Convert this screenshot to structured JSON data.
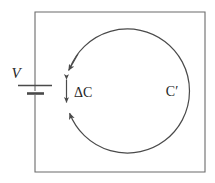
{
  "figure": {
    "type": "circuit-diagram",
    "background_color": "#ffffff",
    "stroke_color": "#4a4a4a",
    "text_color": "#262626",
    "width": 215,
    "height": 183
  },
  "labels": {
    "voltage": "V",
    "delta_c": "ΔC",
    "contour_prime": "C′"
  },
  "elements": {
    "outer_loop_name": "circuit-rectangle",
    "battery_name": "battery-symbol",
    "contour_name": "contour-circle",
    "gap_name": "contour-gap",
    "delta_arrow_name": "delta-c-double-arrow"
  },
  "geometry": {
    "rectangle": {
      "x": 35,
      "y": 12,
      "width": 170,
      "height": 160
    },
    "circle": {
      "cx": 127,
      "cy": 91,
      "r": 62
    },
    "battery": {
      "x": 35,
      "y": 85,
      "long_plate_half_width": 17,
      "short_plate_half_width": 9,
      "plate_gap": 8
    },
    "gap_angle_degrees": 22
  }
}
